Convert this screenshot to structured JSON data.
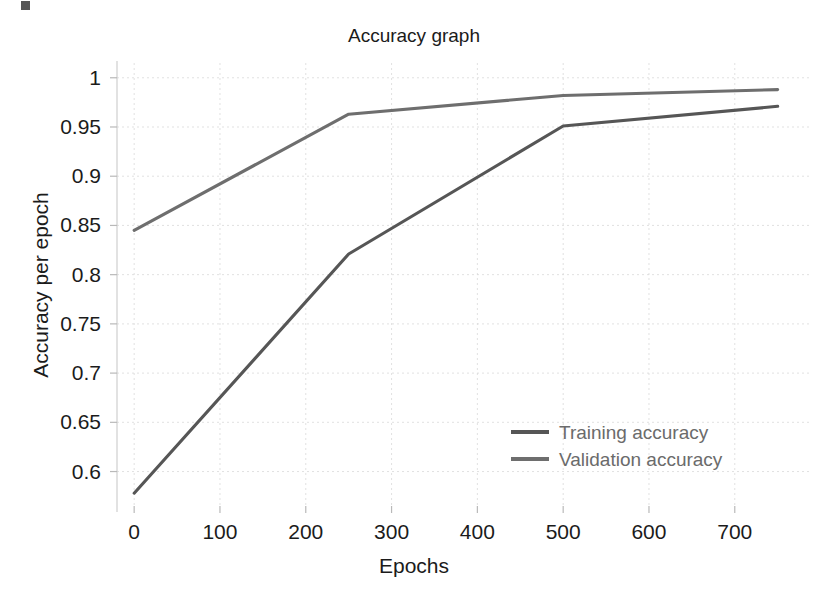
{
  "chart_data": {
    "type": "line",
    "title": "Accuracy graph",
    "xlabel": "Epochs",
    "ylabel": "Accuracy per epoch",
    "xlim": [
      -20,
      790
    ],
    "ylim": [
      0.565,
      1.015
    ],
    "xticks": [
      0,
      100,
      200,
      300,
      400,
      500,
      600,
      700
    ],
    "xtick_labels": [
      "0",
      "100",
      "200",
      "300",
      "400",
      "500",
      "600",
      "700"
    ],
    "yticks": [
      0.6,
      0.65,
      0.7,
      0.75,
      0.8,
      0.85,
      0.9,
      0.95,
      1
    ],
    "ytick_labels": [
      "0.6",
      "0.65",
      "0.7",
      "0.75",
      "0.8",
      "0.85",
      "0.9",
      "0.95",
      "1"
    ],
    "grid": true,
    "legend_position": "lower right",
    "series": [
      {
        "name": "Training accuracy",
        "color": "#565656",
        "x": [
          0,
          250,
          500,
          750
        ],
        "y": [
          0.578,
          0.821,
          0.951,
          0.971
        ]
      },
      {
        "name": "Validation accuracy",
        "color": "#6e6e6e",
        "x": [
          0,
          250,
          500,
          750
        ],
        "y": [
          0.845,
          0.963,
          0.982,
          0.988
        ]
      }
    ]
  },
  "legend": {
    "items": [
      {
        "label": "Training accuracy",
        "color": "#565656"
      },
      {
        "label": "Validation accuracy",
        "color": "#6e6e6e"
      }
    ]
  },
  "page": {
    "background_color": "#ffffff",
    "text_color": "#1b1b1b",
    "grid_color": "#d8d8d8"
  }
}
